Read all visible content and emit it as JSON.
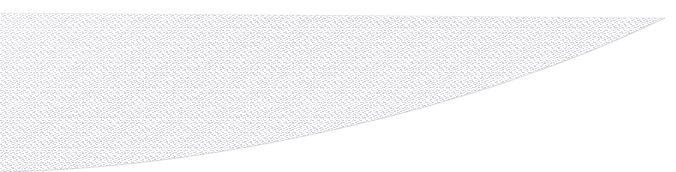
{
  "image": {
    "width": 676,
    "height": 172,
    "background_color": "#ffffff",
    "media": "scanned halftone stipple illustration",
    "subject": "blade-like crescent shape",
    "visible_text": ""
  },
  "shape": {
    "name": "blade-crescent",
    "fill_color": "#d2d2d6",
    "edge_color": "#b9b9c0",
    "tip_point": {
      "x": 665,
      "y": 18
    },
    "top_edge": {
      "description": "near-horizontal spine running left to right",
      "start": {
        "x": 0,
        "y": 13
      },
      "end": {
        "x": 665,
        "y": 18
      }
    },
    "bottom_edge": {
      "description": "concave sweep rising from bottom-left corner to the tip",
      "start": {
        "x": 0,
        "y": 172
      },
      "control_a": {
        "x": 210,
        "y": 168
      },
      "control_b": {
        "x": 470,
        "y": 112
      },
      "end": {
        "x": 665,
        "y": 18
      }
    },
    "path_d": "M 0,13 L 665,18 C 470,112 210,168 0,172 Z"
  },
  "texture": {
    "type": "halftone-stipple",
    "dot_color": "#c9c9ce",
    "dot_color_light": "#e2e2e6",
    "dash_width": 2,
    "dash_height": 1,
    "tile_size": 6,
    "opacity": 0.85
  }
}
